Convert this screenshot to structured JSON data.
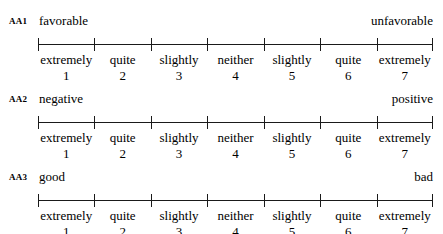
{
  "scale": {
    "points": [
      {
        "label": "extremely",
        "number": "1"
      },
      {
        "label": "quite",
        "number": "2"
      },
      {
        "label": "slightly",
        "number": "3"
      },
      {
        "label": "neither",
        "number": "4"
      },
      {
        "label": "slightly",
        "number": "5"
      },
      {
        "label": "quite",
        "number": "6"
      },
      {
        "label": "extremely",
        "number": "7"
      }
    ]
  },
  "items": [
    {
      "code": "AA1",
      "left_anchor": "favorable",
      "right_anchor": "unfavorable"
    },
    {
      "code": "AA2",
      "left_anchor": "negative",
      "right_anchor": "positive"
    },
    {
      "code": "AA3",
      "left_anchor": "good",
      "right_anchor": "bad"
    }
  ],
  "style": {
    "line_color": "#1a1a1a",
    "text_color": "#000000",
    "background": "#ffffff"
  }
}
